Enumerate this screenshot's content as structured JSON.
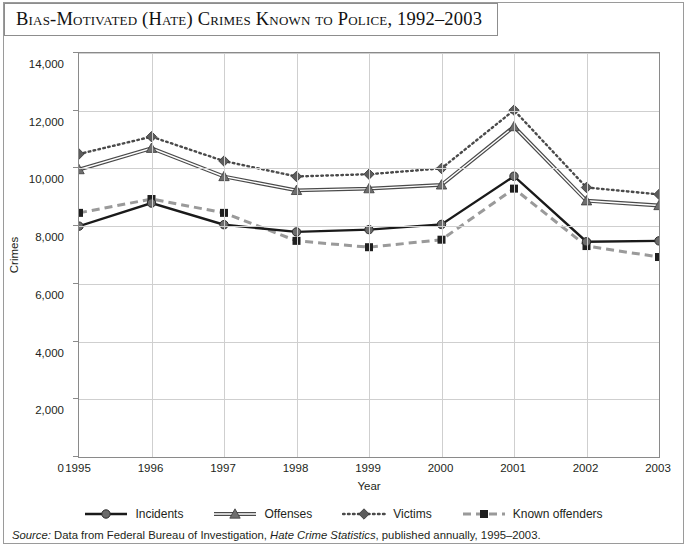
{
  "title": "Bias-Motivated (Hate) Crimes Known to Police, 1992–2003",
  "axis": {
    "ylabel": "Crimes",
    "xlabel": "Year"
  },
  "legend": [
    {
      "label": "Incidents",
      "marker": "circle",
      "style": "solid",
      "color": "#1a1a1a"
    },
    {
      "label": "Offenses",
      "marker": "triangle",
      "style": "double",
      "color": "#5a5a5a"
    },
    {
      "label": "Victims",
      "marker": "diamond",
      "style": "dotted",
      "color": "#4a4a4a"
    },
    {
      "label": "Known offenders",
      "marker": "square",
      "style": "dashed",
      "color": "#9a9a9a"
    }
  ],
  "source": {
    "prefix": "Source:",
    "text_before": " Data from Federal Bureau of Investigation, ",
    "italic_title": "Hate Crime Statistics",
    "text_after": ", published annually, 1995–2003."
  },
  "chart_data": {
    "type": "line",
    "title": "Bias-Motivated (Hate) Crimes Known to Police, 1992–2003",
    "xlabel": "Year",
    "ylabel": "Crimes",
    "x": [
      1995,
      1996,
      1997,
      1998,
      1999,
      2000,
      2001,
      2002,
      2003
    ],
    "xtick_labels": [
      "1995",
      "1996",
      "1997",
      "1998",
      "1999",
      "2000",
      "2001",
      "2002",
      "2003"
    ],
    "ylim": [
      0,
      14000
    ],
    "yticks": [
      0,
      2000,
      4000,
      6000,
      8000,
      10000,
      12000,
      14000
    ],
    "ytick_labels": [
      "0",
      "2,000",
      "4,000",
      "6,000",
      "8,000",
      "10,000",
      "12,000",
      "14,000"
    ],
    "grid": true,
    "legend_position": "bottom",
    "series": [
      {
        "name": "Incidents",
        "color": "#1a1a1a",
        "marker": "circle",
        "linestyle": "solid",
        "values": [
          8000,
          8800,
          8050,
          7800,
          7880,
          8060,
          9730,
          7460,
          7490
        ]
      },
      {
        "name": "Offenses",
        "color": "#5a5a5a",
        "marker": "triangle",
        "linestyle": "double",
        "values": [
          9960,
          10700,
          9720,
          9240,
          9300,
          9430,
          11450,
          8880,
          8715
        ]
      },
      {
        "name": "Victims",
        "color": "#4a4a4a",
        "marker": "diamond",
        "linestyle": "dotted",
        "values": [
          10500,
          11100,
          10255,
          9720,
          9800,
          10000,
          12020,
          9340,
          9100
        ]
      },
      {
        "name": "Known offenders",
        "color": "#9a9a9a",
        "marker": "square",
        "linestyle": "dashed",
        "values": [
          8460,
          8940,
          8460,
          7490,
          7270,
          7530,
          9300,
          7310,
          6930
        ]
      }
    ]
  }
}
